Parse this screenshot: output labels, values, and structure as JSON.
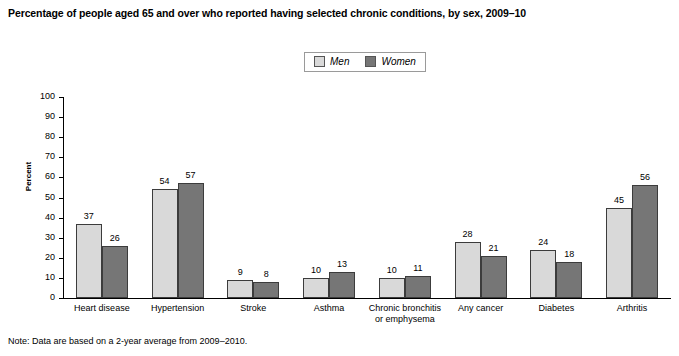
{
  "title": "Percentage of people aged 65 and over who reported having selected chronic conditions, by sex, 2009–10",
  "legend": {
    "men_label": "Men",
    "women_label": "Women"
  },
  "axis": {
    "y_title": "Percent",
    "y_ticks": [
      "100",
      "90",
      "80",
      "70",
      "60",
      "50",
      "40",
      "30",
      "20",
      "10",
      "0"
    ]
  },
  "note": "Note: Data are based on a 2-year average from 2009–2010.",
  "source_partial": "",
  "colors": {
    "men": "#d9d9d9",
    "women": "#767676",
    "bar_outline": "#3c3c3c",
    "axis": "#000000"
  },
  "chart_data": {
    "type": "bar",
    "title": "Percentage of people aged 65 and over who reported having selected chronic conditions, by sex, 2009–10",
    "xlabel": "",
    "ylabel": "Percent",
    "ylim": [
      0,
      100
    ],
    "ytick_step": 10,
    "grid": false,
    "legend_position": "top-center",
    "categories": [
      "Heart disease",
      "Hypertension",
      "Stroke",
      "Asthma",
      "Chronic bronchitis or emphysema",
      "Any cancer",
      "Diabetes",
      "Arthritis"
    ],
    "categories_wrapped": [
      [
        "Heart disease"
      ],
      [
        "Hypertension"
      ],
      [
        "Stroke"
      ],
      [
        "Asthma"
      ],
      [
        "Chronic bronchitis",
        "or emphysema"
      ],
      [
        "Any cancer"
      ],
      [
        "Diabetes"
      ],
      [
        "Arthritis"
      ]
    ],
    "series": [
      {
        "name": "Men",
        "values": [
          37,
          54,
          9,
          10,
          10,
          28,
          24,
          45
        ]
      },
      {
        "name": "Women",
        "values": [
          26,
          57,
          8,
          13,
          11,
          21,
          18,
          56
        ]
      }
    ],
    "note": "Note: Data are based on a 2-year average from 2009–2010."
  }
}
